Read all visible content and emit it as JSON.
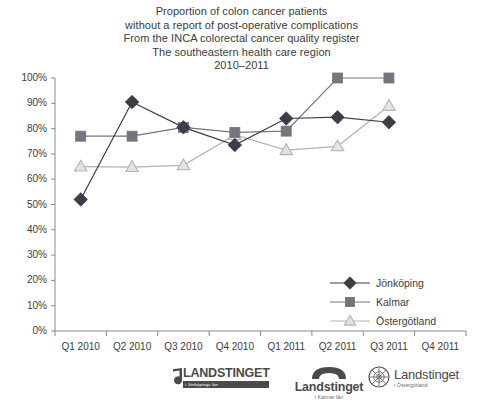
{
  "title": {
    "lines": [
      "Proportion of colon cancer patients",
      "without a report of post-operative complications",
      "From the INCA colorectal cancer quality register",
      "The southeastern health care region",
      "2010–2011"
    ]
  },
  "chart_data": {
    "type": "line",
    "xlabel": "",
    "ylabel": "",
    "categories": [
      "Q1 2010",
      "Q2 2010",
      "Q3 2010",
      "Q4 2010",
      "Q1 2011",
      "Q2 2011",
      "Q3 2011",
      "Q4 2011"
    ],
    "ylim": [
      0,
      100
    ],
    "ytick_step": 10,
    "ytick_labels": [
      "0%",
      "10%",
      "20%",
      "30%",
      "40%",
      "50%",
      "60%",
      "70%",
      "80%",
      "90%",
      "100%"
    ],
    "grid": false,
    "legend_position": "inside-right",
    "series": [
      {
        "name": "Jönköping",
        "marker": "diamond",
        "color": "#3d3d47",
        "values": [
          52,
          90.5,
          80.5,
          73.5,
          84,
          84.5,
          82.5,
          null
        ]
      },
      {
        "name": "Kalmar",
        "marker": "square",
        "color": "#757580",
        "values": [
          77,
          77,
          80.5,
          78.5,
          79,
          100,
          100,
          null
        ]
      },
      {
        "name": "Östergötland",
        "marker": "triangle",
        "color": "#b2b2bb",
        "values": [
          65,
          64.8,
          65.5,
          77.5,
          71.5,
          73,
          89,
          null
        ]
      }
    ]
  },
  "legend": {
    "items": [
      {
        "label": "Jönköping",
        "marker": "diamond",
        "color": "#3d3d47"
      },
      {
        "label": "Kalmar",
        "marker": "square",
        "color": "#757580"
      },
      {
        "label": "Östergötland",
        "marker": "triangle",
        "color": "#b2b2bb"
      }
    ]
  },
  "footer": {
    "logos": [
      {
        "name": "landstinget-jonkopings-lan",
        "main": "LANDSTINGET",
        "sub": "i Jönköpings län"
      },
      {
        "name": "landstinget-kalmar-lan",
        "main": "Landstinget",
        "sub": "i Kalmar län"
      },
      {
        "name": "landstinget-ostergotland",
        "main": "Landstinget",
        "sub": "i Östergötland"
      }
    ]
  },
  "colors": {
    "axis": "#8a8a8a",
    "text": "#3c3c3c",
    "jonkoping": "#3d3d47",
    "kalmar": "#757580",
    "ostergotland": "#b2b2bb"
  }
}
